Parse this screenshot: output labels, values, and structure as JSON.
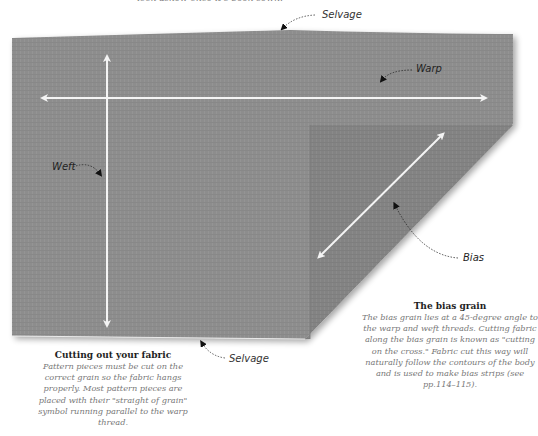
{
  "top_caption": "look askew once it's been sewn.",
  "diagram": {
    "fabric_color": "#8d8d8d",
    "fold_color": "#838383",
    "arrow_color": "#f4f4f4",
    "labels": {
      "selvage_top": "Selvage",
      "warp": "Warp",
      "weft": "Weft",
      "bias": "Bias",
      "selvage_bottom": "Selvage"
    }
  },
  "captions": {
    "cutting": {
      "title": "Cutting out your fabric",
      "body": "Pattern pieces must be cut on the correct grain so the fabric hangs properly. Most pattern pieces are placed with their \"straight of grain\" symbol running parallel to the warp thread."
    },
    "bias": {
      "title": "The bias grain",
      "body": "The bias grain lies at a 45-degree angle to the warp and weft threads. Cutting fabric along the bias grain is known as \"cutting on the cross.\" Fabric cut this way will naturally follow the contours of the body and is used to make bias strips (see pp.114–115)."
    }
  }
}
